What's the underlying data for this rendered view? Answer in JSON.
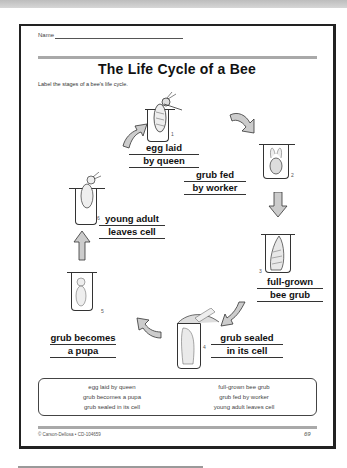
{
  "worksheet": {
    "name_label": "Name",
    "title": "The Life Cycle of a Bee",
    "instructions": "Label the stages of a bee's life cycle.",
    "stages": [
      {
        "number": "1",
        "line1": "egg laid",
        "line2": "by queen"
      },
      {
        "number": "2",
        "line1": "grub fed",
        "line2": "by worker"
      },
      {
        "number": "3",
        "line1": "full-grown",
        "line2": "bee grub"
      },
      {
        "number": "4",
        "line1": "grub sealed",
        "line2": "in its cell"
      },
      {
        "number": "5",
        "line1": "grub becomes",
        "line2": "a pupa"
      },
      {
        "number": "6",
        "line1": "young adult",
        "line2": "leaves cell"
      }
    ],
    "word_bank": {
      "left": [
        "egg laid by queen",
        "grub becomes a pupa",
        "grub sealed in its cell"
      ],
      "right": [
        "full-grown bee grub",
        "grub fed by worker",
        "young adult leaves cell"
      ]
    },
    "footer": {
      "copyright": "© Carson-Dellosa • CD-104659",
      "page_number": "69"
    }
  }
}
